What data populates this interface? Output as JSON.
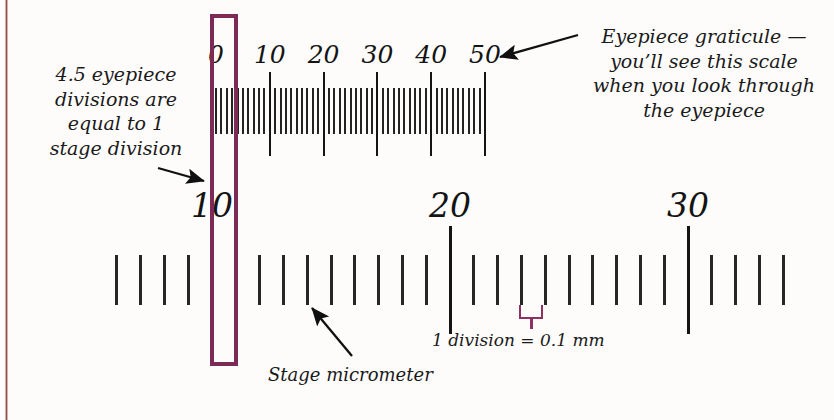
{
  "figure": {
    "accent_purple": "#7e2a56",
    "bracket_purple": "#8d3160",
    "edge_rule_color": "#8a4a46",
    "ink_color": "#141414",
    "background": "#fdfcfb"
  },
  "annotations": {
    "left_note": "4.5 eyepiece\ndivisions are\nequal to 1\nstage division",
    "right_note": "Eyepiece graticule —\nyou’ll see this scale\nwhen you look through\nthe eyepiece",
    "stage_label": "Stage micrometer",
    "division_label": "1 division = 0.1 mm"
  },
  "eyepiece_scale": {
    "name": "eyepiece-graticule",
    "labels": [
      "0",
      "10",
      "20",
      "30",
      "40",
      "50"
    ],
    "label_values": [
      0,
      10,
      20,
      30,
      40,
      50
    ],
    "major_tick_values": [
      0,
      10,
      20,
      30,
      40,
      50
    ],
    "minor_tick_count": 51,
    "min": 0,
    "max": 50
  },
  "stage_scale": {
    "name": "stage-micrometer",
    "labels": [
      "10",
      "20",
      "30"
    ],
    "label_values": [
      10,
      20,
      30
    ],
    "major_tick_values": [
      10,
      20,
      30
    ],
    "division_mm": 0.1,
    "min": 4,
    "max": 34
  },
  "relationship": {
    "eyepiece_divisions_per_stage_division": 4.5
  }
}
